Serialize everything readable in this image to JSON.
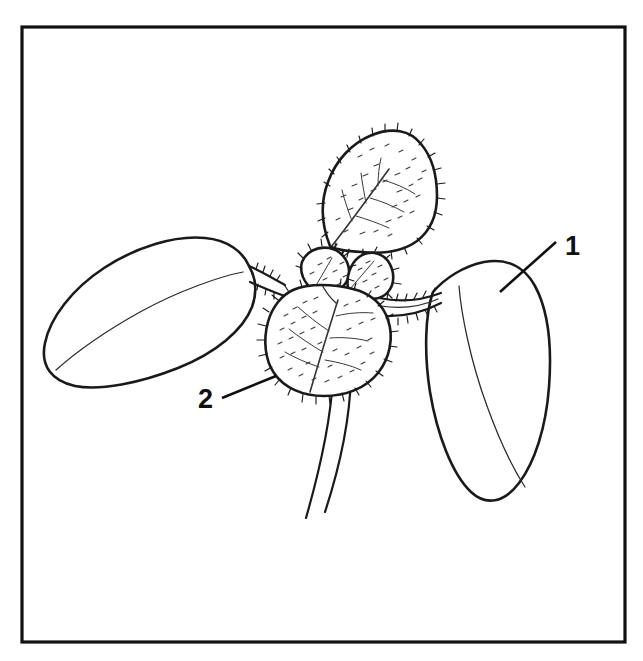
{
  "figure": {
    "background_color": "#ffffff",
    "ink_color": "#111111",
    "frame": {
      "name": "figure-border",
      "x": 22,
      "y": 27,
      "width": 603,
      "height": 615,
      "stroke_width": 3,
      "color": "#111111"
    },
    "callouts": [
      {
        "id": "callout-1",
        "label": "1",
        "part": "cotyledon",
        "text_x": 565,
        "text_y": 255,
        "leader_start_x": 556,
        "leader_start_y": 242,
        "leader_end_x": 500,
        "leader_end_y": 292
      },
      {
        "id": "callout-2",
        "label": "2",
        "part": "true-leaf",
        "text_x": 198,
        "text_y": 408,
        "leader_start_x": 222,
        "leader_start_y": 398,
        "leader_end_x": 276,
        "leader_end_y": 376
      }
    ],
    "parts": [
      {
        "name": "left-cotyledon",
        "label": ""
      },
      {
        "name": "right-cotyledon",
        "label": "1"
      },
      {
        "name": "lower-true-leaf",
        "label": "2"
      },
      {
        "name": "upper-true-leaf",
        "label": ""
      },
      {
        "name": "leaflet-cluster",
        "label": ""
      },
      {
        "name": "hypocotyl",
        "label": ""
      }
    ]
  }
}
